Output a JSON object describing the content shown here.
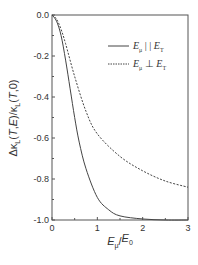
{
  "chart_data": {
    "type": "line",
    "title": "",
    "xlabel": "E_μ/E_0",
    "ylabel": "Δκ_L(T,E)/κ_L(T,0)",
    "xlim": [
      0,
      3
    ],
    "ylim": [
      -1.0,
      0.0
    ],
    "xticks": [
      "0",
      "1",
      "2",
      "3"
    ],
    "yticks": [
      "0.0",
      "-0.2",
      "-0.4",
      "-0.6",
      "-0.8",
      "-1.0"
    ],
    "grid": false,
    "legend_position": "upper right",
    "series": [
      {
        "name": "E_μ || E_T",
        "style": "solid",
        "x": [
          0,
          0.1,
          0.2,
          0.3,
          0.4,
          0.5,
          0.6,
          0.75,
          1.0,
          1.25,
          1.5,
          2.0,
          2.5,
          3.0
        ],
        "y": [
          0,
          -0.03,
          -0.1,
          -0.22,
          -0.36,
          -0.5,
          -0.62,
          -0.75,
          -0.89,
          -0.95,
          -0.98,
          -0.995,
          -1.0,
          -1.0
        ]
      },
      {
        "name": "E_μ ⊥ E_T",
        "style": "dashed",
        "x": [
          0,
          0.1,
          0.2,
          0.3,
          0.5,
          0.75,
          1.0,
          1.5,
          2.0,
          2.5,
          3.0
        ],
        "y": [
          0,
          -0.02,
          -0.07,
          -0.14,
          -0.3,
          -0.47,
          -0.58,
          -0.69,
          -0.76,
          -0.81,
          -0.84
        ]
      }
    ]
  },
  "labels": {
    "xlabel_main": "E",
    "xlabel_sub": "μ",
    "xlabel_sep": "/E",
    "xlabel_sub2": "0",
    "ylabel": "Δκ",
    "legend": [
      {
        "E": "E",
        "sub1": "μ",
        "rel": "| |",
        "E2": "E",
        "sub2": "T"
      },
      {
        "E": "E",
        "sub1": "μ",
        "rel": "⊥",
        "E2": "E",
        "sub2": "T"
      }
    ]
  },
  "colors": {
    "axis": "#555555",
    "line": "#444444"
  }
}
